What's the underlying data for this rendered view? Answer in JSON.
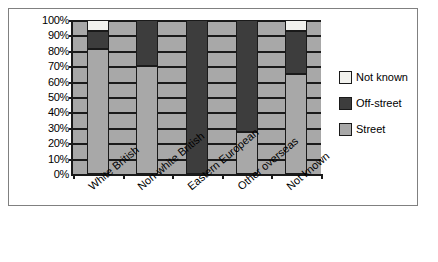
{
  "chart_data": {
    "type": "bar",
    "subtype": "stacked-100-percent",
    "title": "",
    "xlabel": "",
    "ylabel": "",
    "ylim": [
      0,
      100
    ],
    "ytick_labels": [
      "100%",
      "90%",
      "80%",
      "70%",
      "60%",
      "50%",
      "40%",
      "30%",
      "20%",
      "10%",
      "0%"
    ],
    "ytick_values": [
      100,
      90,
      80,
      70,
      60,
      50,
      40,
      30,
      20,
      10,
      0
    ],
    "grid": true,
    "legend_position": "right",
    "categories": [
      "White British",
      "Non-white British",
      "Eastern European",
      "Other overseas",
      "Not known"
    ],
    "series": [
      {
        "name": "Street",
        "color": "#a8a8a8",
        "values": [
          81,
          70,
          0,
          27,
          65
        ]
      },
      {
        "name": "Off-street",
        "color": "#3d3d3d",
        "values": [
          12,
          30,
          100,
          73,
          28
        ]
      },
      {
        "name": "Not known",
        "color": "#f2f2ee",
        "values": [
          7,
          0,
          0,
          0,
          7
        ]
      }
    ]
  },
  "legend": {
    "entries": [
      {
        "label": "Not known",
        "key": "unknown"
      },
      {
        "label": "Off-street",
        "key": "off"
      },
      {
        "label": "Street",
        "key": "street"
      }
    ]
  },
  "colors": {
    "street": "#a8a8a8",
    "off_street": "#3d3d3d",
    "not_known": "#f2f2ee",
    "axis": "#1a1a1a",
    "frame": "#808080",
    "background": "#ffffff"
  }
}
